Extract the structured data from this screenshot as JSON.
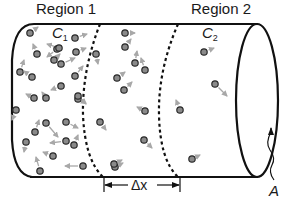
{
  "labels": {
    "region1": "Region 1",
    "region2": "Region 2",
    "c1": "C",
    "c1_sub": "1",
    "c2": "C",
    "c2_sub": "2",
    "delta_x": "Δx",
    "area": "A"
  },
  "colors": {
    "outline": "#111111",
    "particle_fill": "#8a8a8a",
    "particle_stroke": "#2a2a2a",
    "arrow": "#a8a8a8",
    "background": "#ffffff"
  },
  "particles": [
    {
      "x": 30,
      "y": 33,
      "dx": 8,
      "dy": -6
    },
    {
      "x": 75,
      "y": 38,
      "dx": 12,
      "dy": -4
    },
    {
      "x": 125,
      "y": 33,
      "dx": 10,
      "dy": 0
    },
    {
      "x": 57,
      "y": 49,
      "dx": -10,
      "dy": 8
    },
    {
      "x": 59,
      "y": 48,
      "dx": -12,
      "dy": -4
    },
    {
      "x": 76,
      "y": 52,
      "dx": 10,
      "dy": -4
    },
    {
      "x": 96,
      "y": 54,
      "dx": 2,
      "dy": 10
    },
    {
      "x": 125,
      "y": 47,
      "dx": 6,
      "dy": -8
    },
    {
      "x": 37,
      "y": 54,
      "dx": -4,
      "dy": -10
    },
    {
      "x": 54,
      "y": 60,
      "dx": 6,
      "dy": -6
    },
    {
      "x": 61,
      "y": 64,
      "dx": 14,
      "dy": -6
    },
    {
      "x": 20,
      "y": 72,
      "dx": 4,
      "dy": -12
    },
    {
      "x": 32,
      "y": 77,
      "dx": -8,
      "dy": -6
    },
    {
      "x": 75,
      "y": 76,
      "dx": 8,
      "dy": -10
    },
    {
      "x": 117,
      "y": 78,
      "dx": 8,
      "dy": -6
    },
    {
      "x": 135,
      "y": 63,
      "dx": 2,
      "dy": -12
    },
    {
      "x": 61,
      "y": 86,
      "dx": -10,
      "dy": 4
    },
    {
      "x": 34,
      "y": 98,
      "dx": -8,
      "dy": -4
    },
    {
      "x": 46,
      "y": 98,
      "dx": -4,
      "dy": -6
    },
    {
      "x": 78,
      "y": 99,
      "dx": 8,
      "dy": 4
    },
    {
      "x": 124,
      "y": 90,
      "dx": 8,
      "dy": -8
    },
    {
      "x": 78,
      "y": 96,
      "dx": 8,
      "dy": 8
    },
    {
      "x": 16,
      "y": 110,
      "dx": -4,
      "dy": 10
    },
    {
      "x": 35,
      "y": 132,
      "dx": 4,
      "dy": -12
    },
    {
      "x": 46,
      "y": 123,
      "dx": 12,
      "dy": 14
    },
    {
      "x": 66,
      "y": 122,
      "dx": 12,
      "dy": 6
    },
    {
      "x": 100,
      "y": 122,
      "dx": 6,
      "dy": 8
    },
    {
      "x": 26,
      "y": 142,
      "dx": -2,
      "dy": 10
    },
    {
      "x": 66,
      "y": 141,
      "dx": -16,
      "dy": 2
    },
    {
      "x": 74,
      "y": 145,
      "dx": 4,
      "dy": -10
    },
    {
      "x": 53,
      "y": 156,
      "dx": -10,
      "dy": -4
    },
    {
      "x": 83,
      "y": 166,
      "dx": -18,
      "dy": 0
    },
    {
      "x": 40,
      "y": 171,
      "dx": -4,
      "dy": -14
    },
    {
      "x": 145,
      "y": 111,
      "dx": -8,
      "dy": -4
    },
    {
      "x": 144,
      "y": 140,
      "dx": 8,
      "dy": 8
    },
    {
      "x": 115,
      "y": 167,
      "dx": 8,
      "dy": -4
    },
    {
      "x": 145,
      "y": 70,
      "dx": -4,
      "dy": -12
    },
    {
      "x": 114,
      "y": 164,
      "dx": 8,
      "dy": -4
    },
    {
      "x": 204,
      "y": 52,
      "dx": 10,
      "dy": -4
    },
    {
      "x": 215,
      "y": 84,
      "dx": 12,
      "dy": 12
    },
    {
      "x": 180,
      "y": 110,
      "dx": -4,
      "dy": -10
    },
    {
      "x": 192,
      "y": 159,
      "dx": 8,
      "dy": -4
    }
  ]
}
